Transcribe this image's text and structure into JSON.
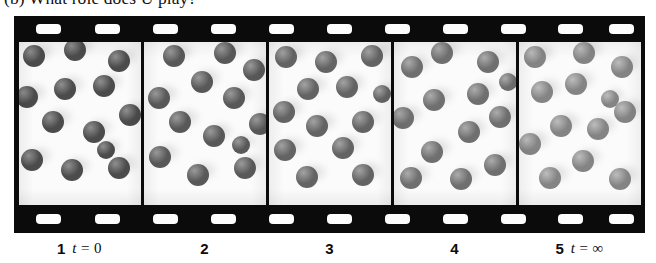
{
  "caption_top": {
    "text": "(b) What role does U play?"
  },
  "filmstrip": {
    "sprocket_band_top": {
      "hole_count": 11,
      "hole_positions_pct": [
        5.5,
        14.8,
        24.0,
        33.2,
        42.4,
        51.6,
        60.8,
        70.0,
        79.2,
        88.2,
        96.2
      ]
    },
    "sprocket_band_bottom": {
      "hole_count": 11,
      "hole_positions_pct": [
        5.5,
        14.8,
        24.0,
        33.2,
        42.4,
        51.6,
        60.8,
        70.0,
        79.2,
        88.2,
        96.2
      ]
    },
    "frame_border_color": "#0b0b0b",
    "frame_background_color": "#fbfbfb"
  },
  "frames": [
    {
      "index": 1,
      "label_number": "1",
      "label_time_prefix": "t",
      "label_time_value": " = 0",
      "sphere_color": "#4b4b4b",
      "sphere_highlight_color": "#8f8f8f",
      "sphere_count": 13,
      "spheres": [
        {
          "x": 16,
          "y": 14,
          "r": 11
        },
        {
          "x": 57,
          "y": 8,
          "r": 11
        },
        {
          "x": 101,
          "y": 19,
          "r": 11
        },
        {
          "x": 47,
          "y": 47,
          "r": 11
        },
        {
          "x": 86,
          "y": 44,
          "r": 11
        },
        {
          "x": 9,
          "y": 55,
          "r": 11
        },
        {
          "x": 112,
          "y": 73,
          "r": 11
        },
        {
          "x": 35,
          "y": 80,
          "r": 11
        },
        {
          "x": 76,
          "y": 90,
          "r": 11
        },
        {
          "x": 14,
          "y": 118,
          "r": 11
        },
        {
          "x": 54,
          "y": 128,
          "r": 11
        },
        {
          "x": 101,
          "y": 126,
          "r": 11
        },
        {
          "x": 88,
          "y": 108,
          "r": 9
        }
      ]
    },
    {
      "index": 2,
      "label_number": "2",
      "label_time_prefix": "",
      "label_time_value": "",
      "sphere_color": "#585858",
      "sphere_highlight_color": "#9a9a9a",
      "sphere_count": 13,
      "spheres": [
        {
          "x": 31,
          "y": 14,
          "r": 11
        },
        {
          "x": 82,
          "y": 11,
          "r": 11
        },
        {
          "x": 111,
          "y": 28,
          "r": 11
        },
        {
          "x": 59,
          "y": 40,
          "r": 11
        },
        {
          "x": 16,
          "y": 56,
          "r": 11
        },
        {
          "x": 91,
          "y": 56,
          "r": 11
        },
        {
          "x": 37,
          "y": 80,
          "r": 11
        },
        {
          "x": 117,
          "y": 82,
          "r": 11
        },
        {
          "x": 71,
          "y": 94,
          "r": 11
        },
        {
          "x": 17,
          "y": 115,
          "r": 11
        },
        {
          "x": 55,
          "y": 133,
          "r": 11
        },
        {
          "x": 102,
          "y": 126,
          "r": 11
        },
        {
          "x": 98,
          "y": 103,
          "r": 9
        }
      ]
    },
    {
      "index": 3,
      "label_number": "3",
      "label_time_prefix": "",
      "label_time_value": "",
      "sphere_color": "#636363",
      "sphere_highlight_color": "#a3a3a3",
      "sphere_count": 13,
      "spheres": [
        {
          "x": 18,
          "y": 15,
          "r": 11
        },
        {
          "x": 58,
          "y": 20,
          "r": 11
        },
        {
          "x": 104,
          "y": 14,
          "r": 11
        },
        {
          "x": 40,
          "y": 47,
          "r": 11
        },
        {
          "x": 79,
          "y": 45,
          "r": 11
        },
        {
          "x": 16,
          "y": 70,
          "r": 11
        },
        {
          "x": 95,
          "y": 80,
          "r": 11
        },
        {
          "x": 49,
          "y": 84,
          "r": 11
        },
        {
          "x": 17,
          "y": 108,
          "r": 11
        },
        {
          "x": 75,
          "y": 106,
          "r": 11
        },
        {
          "x": 39,
          "y": 135,
          "r": 11
        },
        {
          "x": 95,
          "y": 133,
          "r": 11
        },
        {
          "x": 114,
          "y": 52,
          "r": 9
        }
      ]
    },
    {
      "index": 4,
      "label_number": "4",
      "label_time_prefix": "",
      "label_time_value": "",
      "sphere_color": "#6f6f6f",
      "sphere_highlight_color": "#acacac",
      "sphere_count": 13,
      "spheres": [
        {
          "x": 19,
          "y": 25,
          "r": 11
        },
        {
          "x": 49,
          "y": 11,
          "r": 11
        },
        {
          "x": 95,
          "y": 20,
          "r": 11
        },
        {
          "x": 85,
          "y": 52,
          "r": 11
        },
        {
          "x": 41,
          "y": 58,
          "r": 11
        },
        {
          "x": 10,
          "y": 76,
          "r": 11
        },
        {
          "x": 107,
          "y": 75,
          "r": 11
        },
        {
          "x": 76,
          "y": 90,
          "r": 11
        },
        {
          "x": 39,
          "y": 110,
          "r": 11
        },
        {
          "x": 18,
          "y": 136,
          "r": 11
        },
        {
          "x": 68,
          "y": 137,
          "r": 11
        },
        {
          "x": 102,
          "y": 123,
          "r": 11
        },
        {
          "x": 115,
          "y": 40,
          "r": 9
        }
      ]
    },
    {
      "index": 5,
      "label_number": "5",
      "label_time_prefix": "t",
      "label_time_value": " = ∞",
      "sphere_color": "#848484",
      "sphere_highlight_color": "#bdbdbd",
      "sphere_count": 13,
      "spheres": [
        {
          "x": 17,
          "y": 15,
          "r": 11
        },
        {
          "x": 66,
          "y": 11,
          "r": 11
        },
        {
          "x": 104,
          "y": 25,
          "r": 11
        },
        {
          "x": 58,
          "y": 42,
          "r": 11
        },
        {
          "x": 24,
          "y": 50,
          "r": 11
        },
        {
          "x": 107,
          "y": 70,
          "r": 11
        },
        {
          "x": 43,
          "y": 84,
          "r": 11
        },
        {
          "x": 80,
          "y": 87,
          "r": 11
        },
        {
          "x": 12,
          "y": 102,
          "r": 11
        },
        {
          "x": 65,
          "y": 119,
          "r": 11
        },
        {
          "x": 32,
          "y": 136,
          "r": 11
        },
        {
          "x": 102,
          "y": 137,
          "r": 11
        },
        {
          "x": 92,
          "y": 57,
          "r": 9
        }
      ]
    }
  ]
}
